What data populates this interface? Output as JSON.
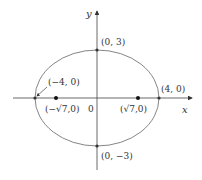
{
  "diagram": {
    "type": "ellipse-plot",
    "equation_params": {
      "a": 4,
      "b": 3,
      "c": "sqrt(7)"
    },
    "axes": {
      "x_label": "x",
      "y_label": "y",
      "origin_label": "0"
    },
    "points": {
      "top_vertex": "(0, 3)",
      "bottom_vertex": "(0, −3)",
      "left_vertex": "(−4, 0)",
      "right_vertex": "(4, 0)",
      "left_focus": "(−√7,0)",
      "right_focus": "(√7,0)"
    },
    "colors": {
      "stroke": "#555555",
      "point": "#222222"
    }
  }
}
